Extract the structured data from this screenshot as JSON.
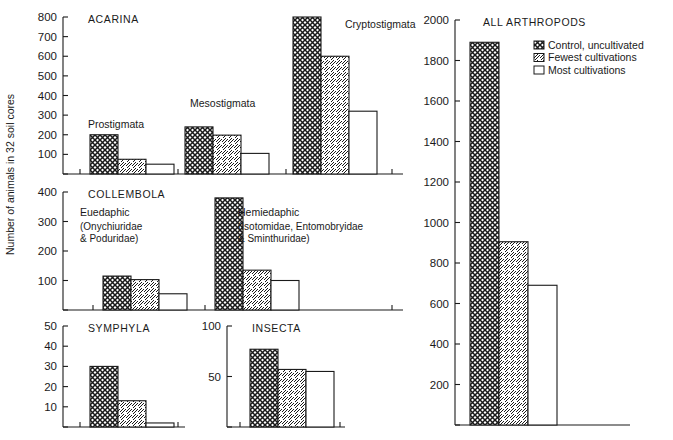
{
  "figure": {
    "ylabel": "Number of animals in 32 soil cores",
    "background": "#ffffff",
    "ink": "#1a1a1a"
  },
  "legend": {
    "position": "top-right",
    "items": [
      {
        "label": "Control, uncultivated",
        "pattern": "cross-hatch"
      },
      {
        "label": "Fewest cultivations",
        "pattern": "diagonal-hatch"
      },
      {
        "label": "Most cultivations",
        "pattern": "blank"
      }
    ]
  },
  "chart_data": [
    {
      "type": "bar",
      "title": "ACARINA",
      "xlabel": "",
      "ylabel": "Number of animals in 32 soil cores",
      "ylim": [
        0,
        800
      ],
      "yticks": [
        100,
        200,
        300,
        400,
        500,
        600,
        700,
        800
      ],
      "grid": false,
      "categories": [
        "Prostigmata",
        "Mesostigmata",
        "Cryptostigmata"
      ],
      "series": [
        {
          "name": "Control, uncultivated",
          "pattern": "cross-hatch",
          "values": [
            200,
            240,
            800
          ]
        },
        {
          "name": "Fewest cultivations",
          "pattern": "diagonal-hatch",
          "values": [
            75,
            198,
            600
          ]
        },
        {
          "name": "Most cultivations",
          "pattern": "blank",
          "values": [
            50,
            105,
            320
          ]
        }
      ]
    },
    {
      "type": "bar",
      "title": "COLLEMBOLA",
      "xlabel": "",
      "ylabel": "Number of animals in 32 soil cores",
      "ylim": [
        0,
        400
      ],
      "yticks": [
        100,
        200,
        300,
        400
      ],
      "grid": false,
      "categories": [
        "Euedaphic",
        "Hemiedaphic"
      ],
      "category_sublabels": [
        [
          "(Onychiuridae",
          "& Poduridae)"
        ],
        [
          "(Isotomidae, Entomobryidae",
          "& Sminthuridae)"
        ]
      ],
      "series": [
        {
          "name": "Control, uncultivated",
          "pattern": "cross-hatch",
          "values": [
            115,
            380
          ]
        },
        {
          "name": "Fewest cultivations",
          "pattern": "diagonal-hatch",
          "values": [
            103,
            135
          ]
        },
        {
          "name": "Most cultivations",
          "pattern": "blank",
          "values": [
            55,
            100
          ]
        }
      ]
    },
    {
      "type": "bar",
      "title": "SYMPHYLA",
      "xlabel": "",
      "ylabel": "Number of animals in 32 soil cores",
      "ylim": [
        0,
        50
      ],
      "yticks": [
        10,
        20,
        30,
        40,
        50
      ],
      "grid": false,
      "categories": [
        ""
      ],
      "series": [
        {
          "name": "Control, uncultivated",
          "pattern": "cross-hatch",
          "values": [
            30
          ]
        },
        {
          "name": "Fewest cultivations",
          "pattern": "diagonal-hatch",
          "values": [
            13
          ]
        },
        {
          "name": "Most cultivations",
          "pattern": "blank",
          "values": [
            2
          ]
        }
      ]
    },
    {
      "type": "bar",
      "title": "INSECTA",
      "xlabel": "",
      "ylabel": "Number of animals in 32 soil cores",
      "ylim": [
        0,
        100
      ],
      "yticks": [
        50,
        100
      ],
      "grid": false,
      "categories": [
        ""
      ],
      "series": [
        {
          "name": "Control, uncultivated",
          "pattern": "cross-hatch",
          "values": [
            77
          ]
        },
        {
          "name": "Fewest cultivations",
          "pattern": "diagonal-hatch",
          "values": [
            57
          ]
        },
        {
          "name": "Most cultivations",
          "pattern": "blank",
          "values": [
            55
          ]
        }
      ]
    },
    {
      "type": "bar",
      "title": "ALL ARTHROPODS",
      "xlabel": "",
      "ylabel": "",
      "ylim": [
        0,
        2000
      ],
      "yticks": [
        200,
        400,
        600,
        800,
        1000,
        1200,
        1400,
        1600,
        1800,
        2000
      ],
      "grid": false,
      "categories": [
        ""
      ],
      "series": [
        {
          "name": "Control, uncultivated",
          "pattern": "cross-hatch",
          "values": [
            1890
          ]
        },
        {
          "name": "Fewest cultivations",
          "pattern": "diagonal-hatch",
          "values": [
            905
          ]
        },
        {
          "name": "Most cultivations",
          "pattern": "blank",
          "values": [
            690
          ]
        }
      ]
    }
  ]
}
